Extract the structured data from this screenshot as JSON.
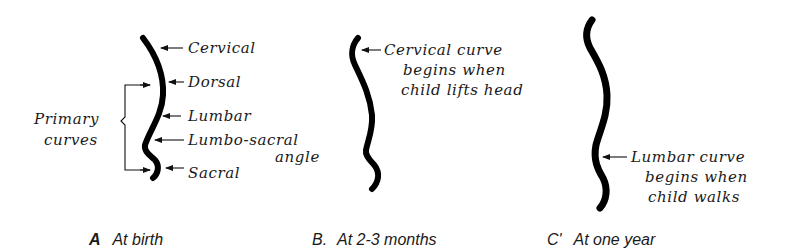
{
  "figure": {
    "panels": [
      {
        "id": "A",
        "caption_letter": "A",
        "caption": "At birth",
        "labels": [
          "Cervical",
          "Dorsal",
          "Lumbar",
          "Lumbo-sacral",
          "angle",
          "Sacral"
        ],
        "bracket_label_line1": "Primary",
        "bracket_label_line2": "curves"
      },
      {
        "id": "B",
        "caption_letter": "B.",
        "caption": "At 2-3 months",
        "note_lines": [
          "Cervical curve",
          "begins when",
          "child lifts head"
        ]
      },
      {
        "id": "C",
        "caption_letter": "C'",
        "caption": "At one year",
        "note_lines": [
          "Lumbar curve",
          "begins when",
          "child walks"
        ]
      }
    ]
  }
}
